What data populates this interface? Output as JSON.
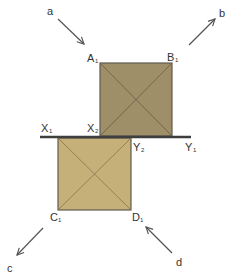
{
  "diagram": {
    "colors": {
      "top_square_fill": "#9e8f68",
      "bottom_square_fill": "#c6b07a",
      "square_stroke": "#5e5a4e",
      "diagonal_stroke": "#6e6248",
      "ground_line": "#3e3e3e",
      "arrow": "#555555"
    },
    "ground_line": {
      "left_label": "X",
      "left_sub": "1",
      "right_label": "Y",
      "right_sub": "1"
    },
    "top_square": {
      "corners": [
        {
          "label": "A",
          "sub": "1"
        },
        {
          "label": "B",
          "sub": "1"
        },
        {
          "label": "X",
          "sub": "2"
        }
      ]
    },
    "bottom_square": {
      "corners": [
        {
          "label": "Y",
          "sub": "2"
        },
        {
          "label": "C",
          "sub": "1"
        },
        {
          "label": "D",
          "sub": "1"
        }
      ]
    },
    "arrows": [
      {
        "label": "a",
        "direction": "down-right"
      },
      {
        "label": "b",
        "direction": "up-right"
      },
      {
        "label": "c",
        "direction": "down-left"
      },
      {
        "label": "d",
        "direction": "up-left"
      }
    ]
  }
}
